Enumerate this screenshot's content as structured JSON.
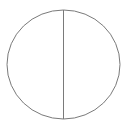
{
  "diagram": {
    "shape": "circle-divided-vertically",
    "stroke_color": "#7a7a7a",
    "background": "#ffffff",
    "ellipse": {
      "cx": 63.5,
      "cy": 64.5,
      "rx": 56.5,
      "ry": 54.5
    },
    "divider": {
      "x": 63.5,
      "y1": 10,
      "y2": 119
    }
  }
}
